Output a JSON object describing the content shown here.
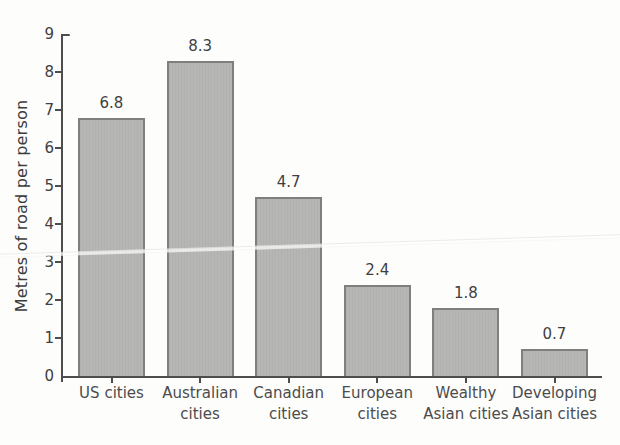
{
  "chart_data": {
    "type": "bar",
    "title": "",
    "ylabel": "Metres of road per person",
    "xlabel": "",
    "categories": [
      "US cities",
      "Australian cities",
      "Canadian cities",
      "European cities",
      "Wealthy Asian cities",
      "Developing Asian cities"
    ],
    "categories_wrapped": [
      [
        "US cities"
      ],
      [
        "Australian",
        "cities"
      ],
      [
        "Canadian",
        "cities"
      ],
      [
        "European",
        "cities"
      ],
      [
        "Wealthy",
        "Asian cities"
      ],
      [
        "Developing",
        "Asian cities"
      ]
    ],
    "values": [
      6.8,
      8.3,
      4.7,
      2.4,
      1.8,
      0.7
    ],
    "data_labels": [
      "6.8",
      "8.3",
      "4.7",
      "2.4",
      "1.8",
      "0.7"
    ],
    "ylim": [
      0,
      9
    ],
    "yticks": [
      0,
      1,
      2,
      3,
      4,
      5,
      6,
      7,
      8,
      9
    ],
    "grid": false,
    "legend": false,
    "colors": {
      "bar_fill": "#b5b5b3",
      "bar_border": "#7f7f7d",
      "axis": "#4d4d4d",
      "text": "#454545",
      "background": "#fdfdfc"
    }
  }
}
